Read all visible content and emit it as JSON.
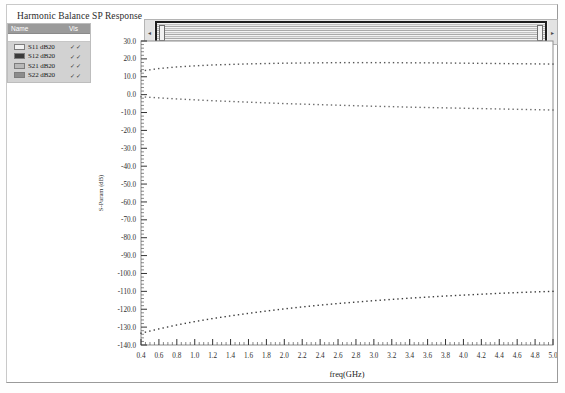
{
  "window": {
    "title": "Harmonic Balance SP Response"
  },
  "legend": {
    "columns": {
      "name": "Name",
      "vis": "Vis"
    },
    "vis_mark": "✓✓",
    "items": [
      {
        "label": "S11 dB20",
        "color": "#f2f2f2",
        "vis": true
      },
      {
        "label": "S12 dB20",
        "color": "#3b3b3b",
        "vis": true
      },
      {
        "label": "S21 dB20",
        "color": "#b8b8b8",
        "vis": true
      },
      {
        "label": "S22 dB20",
        "color": "#8c8c8c",
        "vis": true
      }
    ]
  },
  "scrollbar": {
    "left_arrow": "◂",
    "right_arrow": "▸"
  },
  "chart_data": {
    "type": "line",
    "title": "Harmonic Balance SP Response",
    "xlabel": "freq(GHz)",
    "ylabel": "S-Param (dB)",
    "xlim": [
      0.4,
      5.0
    ],
    "ylim": [
      -140.0,
      30.0
    ],
    "xticks": [
      0.4,
      0.6,
      0.8,
      1.0,
      1.2,
      1.4,
      1.6,
      1.8,
      2.0,
      2.2,
      2.4,
      2.6,
      2.8,
      3.0,
      3.2,
      3.4,
      3.6,
      3.8,
      4.0,
      4.2,
      4.4,
      4.6,
      4.8,
      5.0
    ],
    "xtick_labels": [
      "0.4",
      "0.6",
      "0.8",
      "1.0",
      "1.2",
      "1.4",
      "1.6",
      "1.8",
      "2.0",
      "2.2",
      "2.4",
      "2.6",
      "2.8",
      "3.0",
      "3.2",
      "3.4",
      "3.6",
      "3.8",
      "4.0",
      "4.2",
      "4.4",
      "4.6",
      "4.8",
      "5.0"
    ],
    "yticks": [
      30.0,
      20.0,
      10.0,
      0.0,
      -10.0,
      -20.0,
      -30.0,
      -40.0,
      -50.0,
      -60.0,
      -70.0,
      -80.0,
      -90.0,
      -100.0,
      -110.0,
      -120.0,
      -130.0,
      -140.0
    ],
    "ytick_labels": [
      "30.0",
      "20.0",
      "10.0",
      "0.0",
      "-10.0",
      "-20.0",
      "-30.0",
      "-40.0",
      "-50.0",
      "-60.0",
      "-70.0",
      "-80.0",
      "-90.0",
      "-100.0",
      "-110.0",
      "-120.0",
      "-130.0",
      "-140.0"
    ],
    "grid": false,
    "marker": "dotted",
    "x": [
      0.4,
      0.6,
      0.8,
      1.0,
      1.2,
      1.4,
      1.6,
      1.8,
      2.0,
      2.2,
      2.4,
      2.6,
      2.8,
      3.0,
      3.2,
      3.4,
      3.6,
      3.8,
      4.0,
      4.2,
      4.4,
      4.6,
      4.8,
      5.0
    ],
    "series": [
      {
        "name": "S21 dB20",
        "color": "#555555",
        "values": [
          13.2,
          14.6,
          15.5,
          16.1,
          16.6,
          16.9,
          17.2,
          17.4,
          17.6,
          17.7,
          17.8,
          17.9,
          17.9,
          17.9,
          17.9,
          17.8,
          17.8,
          17.7,
          17.6,
          17.5,
          17.4,
          17.3,
          17.2,
          17.1
        ]
      },
      {
        "name": "S11 dB20",
        "color": "#6a6a6a",
        "values": [
          -1.2,
          -1.8,
          -2.4,
          -2.9,
          -3.4,
          -3.8,
          -4.2,
          -4.6,
          -5.0,
          -5.3,
          -5.6,
          -5.9,
          -6.2,
          -6.5,
          -6.7,
          -7.0,
          -7.2,
          -7.4,
          -7.6,
          -7.8,
          -8.0,
          -8.2,
          -8.4,
          -8.6
        ]
      },
      {
        "name": "S12 dB20",
        "color": "#3b3b3b",
        "values": [
          -133.4,
          -131.0,
          -128.8,
          -126.9,
          -125.2,
          -123.7,
          -122.3,
          -121.0,
          -119.8,
          -118.7,
          -117.7,
          -116.8,
          -116.0,
          -115.2,
          -114.5,
          -113.8,
          -113.2,
          -112.6,
          -112.1,
          -111.6,
          -111.1,
          -110.7,
          -110.3,
          -110.0
        ]
      }
    ]
  }
}
